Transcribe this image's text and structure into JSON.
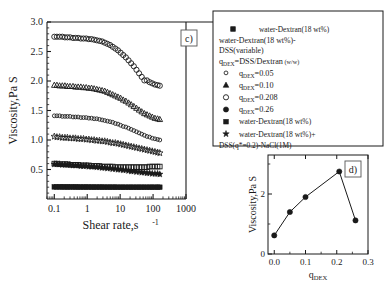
{
  "figure": {
    "panel_c_label": "c)",
    "panel_d_label": "d)"
  },
  "main_axes": {
    "ylabel": "Viscosity,Pa S",
    "xlabel_main": "Shear rate,s",
    "xlabel_sup": "-1",
    "xticks": [
      "0.1",
      "1",
      "10",
      "100",
      "1000"
    ],
    "yticks": [
      "0.5",
      "1.0",
      "1.5",
      "2.0",
      "2.5",
      "3.0"
    ]
  },
  "inset_axes": {
    "ylabel": "Viscosity,Pa S",
    "xlabel_base": "q",
    "xlabel_sub": "DEX",
    "xticks": [
      "0.0",
      "0.1",
      "0.2",
      "0.3"
    ],
    "xticks_minor": [
      "0.05",
      "0.15",
      "0.25"
    ],
    "yticks": [
      "0",
      "2"
    ]
  },
  "legend": {
    "header_marker": "filled-square",
    "header_text": "water-Dextran(18 wt%)",
    "subtitle_line1": "water-Dextran(18 wt%)-",
    "subtitle_line2": "DSS(variable)",
    "ratio_base": "q",
    "ratio_sub": "DEX",
    "ratio_rest": "=DSS/Dextran",
    "ratio_unit": "(w/w)",
    "items": [
      {
        "marker": "small-open-circle",
        "base": "q",
        "sub": "DEX",
        "rest": "=0.05"
      },
      {
        "marker": "filled-triangle",
        "base": "q",
        "sub": "DEX",
        "rest": "=0.10"
      },
      {
        "marker": "open-circle",
        "base": "q",
        "sub": "DEX",
        "rest": "=0.208"
      },
      {
        "marker": "filled-circle",
        "base": "q",
        "sub": "DEX",
        "rest": "=0.26"
      },
      {
        "marker": "filled-square",
        "base": "",
        "sub": "",
        "rest": "water-Dextran(18 wt%)"
      },
      {
        "marker": "filled-star",
        "base": "",
        "sub": "",
        "rest": "water-Dextran(18 wt%)+"
      }
    ],
    "last_line": "DSS(q*=0.2)-NaCl(1M)"
  },
  "chart_data": [
    {
      "type": "scatter",
      "name": "panel-c",
      "title": "",
      "xlabel": "Shear rate, s^-1",
      "ylabel": "Viscosity, Pa S",
      "xscale": "log",
      "xlim": [
        0.06,
        1000
      ],
      "ylim": [
        0.0,
        3.0
      ],
      "grid": false,
      "legend_position": "outside-right",
      "x": [
        0.1,
        0.12,
        0.145,
        0.175,
        0.21,
        0.25,
        0.3,
        0.37,
        0.44,
        0.53,
        0.64,
        0.77,
        0.93,
        1.12,
        1.35,
        1.62,
        1.95,
        2.35,
        2.83,
        3.4,
        4.1,
        4.93,
        5.93,
        7.14,
        8.58,
        10.3,
        12.4,
        14.9,
        18.0,
        21.6,
        26.0,
        31.3,
        37.6,
        45.2,
        54.4,
        65.4,
        78.7,
        94.6,
        113.8,
        136.8,
        160.0
      ],
      "series": [
        {
          "name": "q_DEX=0.208",
          "marker": "open-circle",
          "values": [
            2.75,
            2.75,
            2.75,
            2.75,
            2.74,
            2.74,
            2.74,
            2.73,
            2.73,
            2.73,
            2.72,
            2.72,
            2.72,
            2.71,
            2.71,
            2.7,
            2.69,
            2.68,
            2.67,
            2.65,
            2.63,
            2.61,
            2.58,
            2.55,
            2.52,
            2.48,
            2.44,
            2.4,
            2.35,
            2.3,
            2.25,
            2.19,
            2.13,
            2.07,
            2.01,
            2.01,
            1.98,
            1.96,
            1.94,
            1.93,
            1.92
          ]
        },
        {
          "name": "q_DEX=0.10",
          "marker": "open-triangle",
          "values": [
            1.93,
            1.93,
            1.92,
            1.92,
            1.92,
            1.91,
            1.91,
            1.91,
            1.9,
            1.9,
            1.9,
            1.89,
            1.89,
            1.88,
            1.88,
            1.87,
            1.86,
            1.85,
            1.84,
            1.83,
            1.81,
            1.79,
            1.77,
            1.75,
            1.73,
            1.71,
            1.68,
            1.66,
            1.63,
            1.6,
            1.57,
            1.54,
            1.51,
            1.48,
            1.45,
            1.43,
            1.41,
            1.39,
            1.37,
            1.36,
            1.35
          ]
        },
        {
          "name": "q_DEX=0.05",
          "marker": "small-open-circle",
          "values": [
            1.41,
            1.41,
            1.41,
            1.4,
            1.4,
            1.4,
            1.4,
            1.39,
            1.39,
            1.39,
            1.38,
            1.38,
            1.38,
            1.37,
            1.37,
            1.36,
            1.36,
            1.35,
            1.34,
            1.33,
            1.32,
            1.31,
            1.3,
            1.28,
            1.27,
            1.25,
            1.23,
            1.22,
            1.2,
            1.18,
            1.16,
            1.14,
            1.12,
            1.1,
            1.08,
            1.06,
            1.05,
            1.03,
            1.02,
            1.01,
            1.0
          ]
        },
        {
          "name": "q_DEX=0.26",
          "marker": "open-star",
          "values": [
            1.06,
            1.05,
            1.05,
            1.04,
            1.04,
            1.04,
            1.03,
            1.03,
            1.03,
            1.02,
            1.02,
            1.02,
            1.01,
            1.01,
            1.0,
            1.0,
            0.99,
            0.99,
            0.98,
            0.98,
            0.97,
            0.96,
            0.95,
            0.95,
            0.94,
            0.93,
            0.92,
            0.91,
            0.9,
            0.89,
            0.88,
            0.87,
            0.86,
            0.85,
            0.84,
            0.83,
            0.82,
            0.81,
            0.8,
            0.79,
            0.78
          ]
        },
        {
          "name": "water-Dextran(18 wt%)",
          "marker": "open-square",
          "values": [
            0.6,
            0.6,
            0.59,
            0.59,
            0.59,
            0.59,
            0.58,
            0.58,
            0.58,
            0.58,
            0.57,
            0.57,
            0.57,
            0.57,
            0.56,
            0.56,
            0.56,
            0.56,
            0.55,
            0.55,
            0.55,
            0.55,
            0.55,
            0.54,
            0.54,
            0.54,
            0.54,
            0.54,
            0.54,
            0.54,
            0.54,
            0.54,
            0.54,
            0.54,
            0.54,
            0.54,
            0.55,
            0.55,
            0.55,
            0.55,
            0.55
          ]
        },
        {
          "name": "water-Dextran(18 wt%)+DSS(q*=0.2)-NaCl(1M)",
          "marker": "filled-star",
          "values": [
            0.59,
            0.59,
            0.59,
            0.58,
            0.58,
            0.58,
            0.58,
            0.57,
            0.57,
            0.57,
            0.56,
            0.56,
            0.56,
            0.55,
            0.55,
            0.55,
            0.54,
            0.54,
            0.53,
            0.53,
            0.52,
            0.52,
            0.51,
            0.51,
            0.5,
            0.5,
            0.49,
            0.49,
            0.48,
            0.47,
            0.47,
            0.46,
            0.46,
            0.45,
            0.45,
            0.44,
            0.44,
            0.43,
            0.43,
            0.43,
            0.42
          ]
        },
        {
          "name": "water-Dextran(18 wt%) baseline",
          "marker": "filled-square",
          "values": [
            0.205,
            0.205,
            0.205,
            0.205,
            0.204,
            0.204,
            0.204,
            0.204,
            0.204,
            0.203,
            0.203,
            0.203,
            0.203,
            0.203,
            0.202,
            0.202,
            0.202,
            0.202,
            0.202,
            0.201,
            0.201,
            0.201,
            0.201,
            0.201,
            0.2,
            0.2,
            0.2,
            0.2,
            0.2,
            0.2,
            0.2,
            0.2,
            0.2,
            0.2,
            0.2,
            0.2,
            0.2,
            0.2,
            0.2,
            0.2,
            0.2
          ]
        }
      ]
    },
    {
      "type": "line",
      "name": "panel-d",
      "title": "",
      "xlabel": "q_DEX",
      "ylabel": "Viscosity, Pa S",
      "xscale": "linear",
      "xlim": [
        -0.02,
        0.3
      ],
      "ylim": [
        0,
        3.3
      ],
      "grid": false,
      "marker": "filled-circle",
      "x": [
        0.0,
        0.05,
        0.1,
        0.208,
        0.26
      ],
      "values": [
        0.62,
        1.4,
        1.9,
        2.75,
        1.12
      ]
    }
  ]
}
